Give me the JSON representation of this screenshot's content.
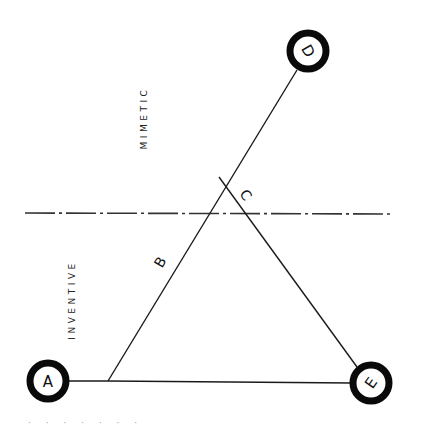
{
  "diagram": {
    "zones": {
      "upper": "MIMETIC",
      "lower": "INVENTIVE"
    },
    "nodes": [
      {
        "id": "A",
        "label": "A"
      },
      {
        "id": "D",
        "label": "D"
      },
      {
        "id": "E",
        "label": "E"
      }
    ],
    "edges": [
      {
        "id": "B",
        "label": "B"
      },
      {
        "id": "C",
        "label": "C"
      }
    ],
    "colors": {
      "ink": "#0a0a0a",
      "background": "#ffffff"
    }
  },
  "footer": {
    "text": "· · ·   ·   · ·   ·"
  }
}
